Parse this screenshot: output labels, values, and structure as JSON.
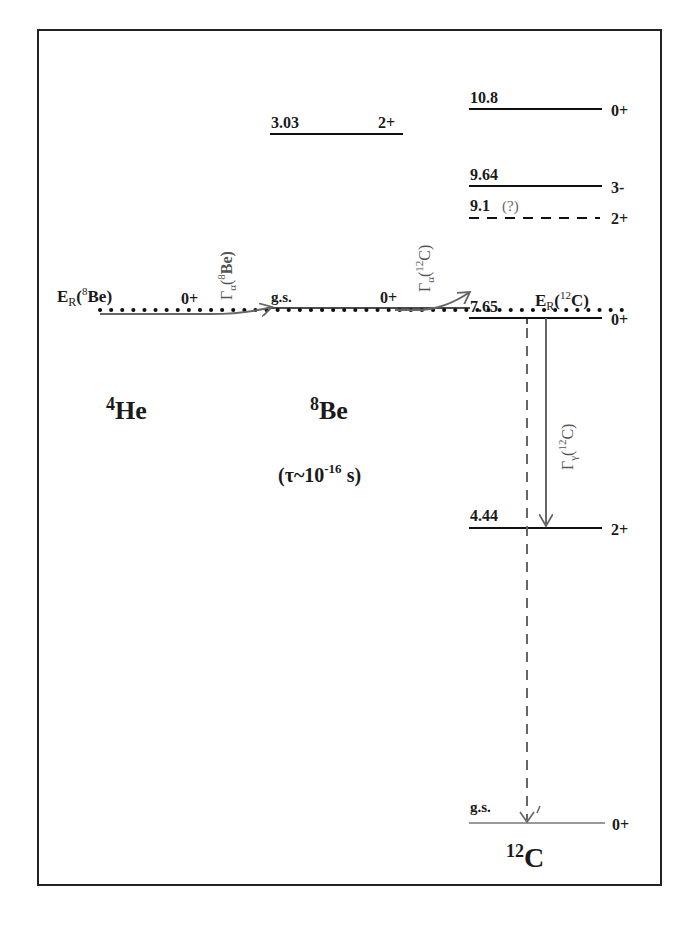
{
  "diagram": {
    "nuclei": [
      {
        "id": "he4",
        "label_mass": "4",
        "label_symbol": "He"
      },
      {
        "id": "be8",
        "label_mass": "8",
        "label_symbol": "Be",
        "lifetime": "(τ~10",
        "lifetime_exp": "-16",
        "lifetime_unit": " s)"
      },
      {
        "id": "c12",
        "label_mass": "12",
        "label_symbol": "C"
      }
    ],
    "be8_levels": [
      {
        "energy": "3.03",
        "spin": "2+"
      },
      {
        "energy": "g.s.",
        "spin": "0+"
      }
    ],
    "he4_level": {
      "spin": "0+",
      "resonance_label": "E",
      "resonance_sub": "R",
      "resonance_paren_open": "(",
      "resonance_sup": "8",
      "resonance_nucleus": "Be)"
    },
    "c12_levels": [
      {
        "energy": "10.8",
        "spin": "0+",
        "style": "solid"
      },
      {
        "energy": "9.64",
        "spin": "3-",
        "style": "solid"
      },
      {
        "energy": "9.1",
        "energy_note": "(?)",
        "spin": "2+",
        "style": "dashed"
      },
      {
        "energy": "7.65",
        "spin": "0+",
        "style": "solid",
        "resonance_label": "E",
        "resonance_sub": "R",
        "resonance_sup": "12",
        "resonance_nucleus": "C)"
      },
      {
        "energy": "4.44",
        "spin": "2+",
        "style": "solid"
      },
      {
        "energy": "g.s.",
        "spin": "0+",
        "style": "gray"
      }
    ],
    "transitions": [
      {
        "label": "Γ",
        "sub": "α",
        "sup": "8",
        "nucleus": "Be)",
        "from": "4He",
        "to": "8Be g.s."
      },
      {
        "label": "Γ",
        "sub": "α",
        "sup": "12",
        "nucleus": "C)",
        "from": "8Be g.s.",
        "to": "12C 7.65"
      },
      {
        "label": "Γ",
        "sub": "γ",
        "sup": "12",
        "nucleus": "C)",
        "from": "7.65",
        "to": "4.44"
      }
    ]
  }
}
